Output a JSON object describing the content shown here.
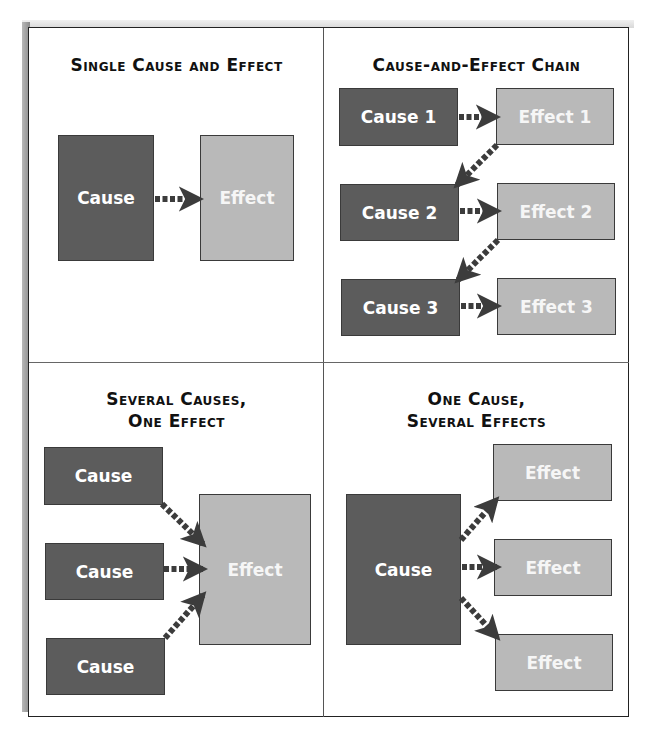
{
  "colors": {
    "cause_fill": "#5c5c5c",
    "effect_fill": "#b9b9b9",
    "arrow": "#3c3c3c",
    "frame": "#222222"
  },
  "panels": [
    {
      "id": "single",
      "title_lines": [
        "Single Cause and Effect"
      ],
      "boxes": [
        {
          "role": "cause",
          "label": "Cause"
        },
        {
          "role": "effect",
          "label": "Effect"
        }
      ],
      "arrows": [
        {
          "from": "Cause",
          "to": "Effect"
        }
      ]
    },
    {
      "id": "chain",
      "title_lines": [
        "Cause-and-Effect Chain"
      ],
      "boxes": [
        {
          "role": "cause",
          "label": "Cause 1"
        },
        {
          "role": "effect",
          "label": "Effect 1"
        },
        {
          "role": "cause",
          "label": "Cause 2"
        },
        {
          "role": "effect",
          "label": "Effect 2"
        },
        {
          "role": "cause",
          "label": "Cause 3"
        },
        {
          "role": "effect",
          "label": "Effect 3"
        }
      ],
      "arrows": [
        {
          "from": "Cause 1",
          "to": "Effect 1"
        },
        {
          "from": "Effect 1",
          "to": "Cause 2"
        },
        {
          "from": "Cause 2",
          "to": "Effect 2"
        },
        {
          "from": "Effect 2",
          "to": "Cause 3"
        },
        {
          "from": "Cause 3",
          "to": "Effect 3"
        }
      ]
    },
    {
      "id": "several-causes",
      "title_lines": [
        "Several Causes,",
        "One Effect"
      ],
      "boxes": [
        {
          "role": "cause",
          "label": "Cause"
        },
        {
          "role": "cause",
          "label": "Cause"
        },
        {
          "role": "cause",
          "label": "Cause"
        },
        {
          "role": "effect",
          "label": "Effect"
        }
      ],
      "arrows": [
        {
          "from": "Cause (top)",
          "to": "Effect"
        },
        {
          "from": "Cause (middle)",
          "to": "Effect"
        },
        {
          "from": "Cause (bottom)",
          "to": "Effect"
        }
      ]
    },
    {
      "id": "several-effects",
      "title_lines": [
        "One Cause,",
        "Several Effects"
      ],
      "boxes": [
        {
          "role": "cause",
          "label": "Cause"
        },
        {
          "role": "effect",
          "label": "Effect"
        },
        {
          "role": "effect",
          "label": "Effect"
        },
        {
          "role": "effect",
          "label": "Effect"
        }
      ],
      "arrows": [
        {
          "from": "Cause",
          "to": "Effect (top)"
        },
        {
          "from": "Cause",
          "to": "Effect (middle)"
        },
        {
          "from": "Cause",
          "to": "Effect (bottom)"
        }
      ]
    }
  ]
}
